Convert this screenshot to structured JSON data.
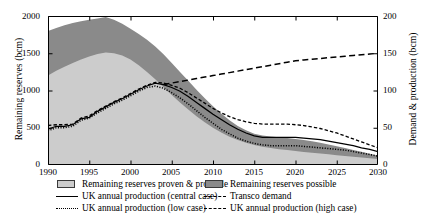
{
  "chart_data": {
    "type": "area",
    "title": "",
    "xlabel": "",
    "ylabel": "Remaining reserves (bcm)",
    "ylabel_right": "Demand & production (bcm)",
    "xlim": [
      1990,
      2030
    ],
    "ylim": [
      0,
      2000
    ],
    "ylim_right": [
      0,
      200
    ],
    "grid": false,
    "legend_position": "below",
    "xticks": [
      "1990",
      "1995",
      "2000",
      "2005",
      "2010",
      "2015",
      "2020",
      "2025",
      "2030"
    ],
    "yticks_left": [
      "0",
      "500",
      "1000",
      "1500",
      "2000"
    ],
    "yticks_right": [
      "0",
      "50",
      "100",
      "150",
      "200"
    ],
    "x": [
      1990,
      1991,
      1992,
      1993,
      1994,
      1995,
      1996,
      1997,
      1998,
      1999,
      2000,
      2001,
      2002,
      2003,
      2004,
      2005,
      2006,
      2007,
      2008,
      2009,
      2010,
      2011,
      2012,
      2013,
      2014,
      2015,
      2016,
      2017,
      2018,
      2019,
      2020,
      2021,
      2022,
      2023,
      2024,
      2025,
      2026,
      2027,
      2028,
      2029,
      2030
    ],
    "series": [
      {
        "name": "Remaining reserves proven & probable",
        "type": "area",
        "axis": "left",
        "color": "#cccccc",
        "values": [
          1200,
          1265,
          1320,
          1370,
          1415,
          1455,
          1490,
          1510,
          1500,
          1470,
          1415,
          1340,
          1250,
          1150,
          1045,
          940,
          840,
          745,
          655,
          575,
          500,
          435,
          380,
          335,
          298,
          268,
          245,
          228,
          213,
          200,
          188,
          176,
          165,
          154,
          143,
          132,
          121,
          110,
          100,
          90,
          80
        ]
      },
      {
        "name": "Remaining reserves possible",
        "type": "area",
        "axis": "left",
        "color": "#8a8a8a",
        "values": [
          1800,
          1840,
          1875,
          1905,
          1930,
          1950,
          1968,
          1985,
          1950,
          1895,
          1830,
          1760,
          1680,
          1590,
          1485,
          1370,
          1250,
          1130,
          1010,
          895,
          790,
          690,
          600,
          525,
          465,
          420,
          395,
          382,
          372,
          362,
          350,
          335,
          318,
          298,
          276,
          252,
          228,
          203,
          178,
          152,
          125
        ]
      },
      {
        "name": "UK annual production (central case)",
        "type": "line",
        "axis": "right",
        "style": "solid",
        "color": "#000000",
        "values": [
          48,
          52,
          52,
          54,
          62,
          64,
          72,
          78,
          84,
          89,
          95,
          101,
          106,
          110,
          108,
          104,
          99,
          92,
          84,
          76,
          68,
          61,
          54,
          48,
          43,
          39,
          37,
          37,
          37,
          37,
          37,
          36,
          35,
          34,
          32,
          30,
          28,
          26,
          23,
          21,
          18
        ]
      },
      {
        "name": "UK annual production (low case)",
        "type": "line",
        "axis": "right",
        "style": "dotted",
        "color": "#000000",
        "values": [
          46,
          50,
          50,
          52,
          60,
          63,
          70,
          76,
          82,
          87,
          93,
          99,
          104,
          106,
          103,
          97,
          90,
          82,
          73,
          64,
          56,
          48,
          42,
          36,
          32,
          29,
          27,
          26,
          26,
          26,
          26,
          25,
          24,
          23,
          22,
          21,
          20,
          18,
          16,
          14,
          12
        ]
      },
      {
        "name": "UK annual production (high case)",
        "type": "line",
        "axis": "right",
        "style": "dashed-short",
        "color": "#000000",
        "values": [
          53,
          54,
          54,
          55,
          63,
          66,
          73,
          79,
          85,
          90,
          96,
          102,
          107,
          111,
          110,
          107,
          103,
          97,
          90,
          83,
          76,
          70,
          65,
          61,
          58,
          56,
          55,
          55,
          55,
          55,
          54,
          53,
          51,
          49,
          46,
          43,
          39,
          35,
          31,
          27,
          23
        ]
      },
      {
        "name": "Transco demand",
        "type": "line",
        "axis": "right",
        "style": "dashed-long",
        "color": "#000000",
        "values": [
          null,
          null,
          null,
          null,
          null,
          null,
          null,
          null,
          null,
          null,
          null,
          null,
          null,
          null,
          108,
          110,
          112,
          114,
          116,
          118,
          120,
          122,
          124,
          126,
          128,
          130,
          132,
          134,
          136,
          138,
          140,
          141,
          142,
          143,
          144,
          145,
          146,
          147,
          148,
          149,
          150
        ]
      }
    ]
  },
  "axes": {
    "left_title": "Remaining reserves (bcm)",
    "right_title": "Demand & production (bcm)",
    "x_ticks": [
      "1990",
      "1995",
      "2000",
      "2005",
      "2010",
      "2015",
      "2020",
      "2025",
      "2030"
    ],
    "y_ticks_left": [
      "0",
      "500",
      "1000",
      "1500",
      "2000"
    ],
    "y_ticks_right": [
      "0",
      "50",
      "100",
      "150",
      "200"
    ]
  },
  "legend": {
    "items": [
      {
        "key": "swatch-light",
        "label": "Remaining reserves proven & probable"
      },
      {
        "key": "swatch-dark",
        "label": "Remaining reserves possible"
      },
      {
        "key": "line-solid",
        "label": "UK annual production (central case)"
      },
      {
        "key": "line-dashed-long",
        "label": "Transco demand"
      },
      {
        "key": "line-dotted",
        "label": "UK annual production (low case)"
      },
      {
        "key": "line-dashed-short",
        "label": "UK annual production (high case)"
      }
    ]
  },
  "colors": {
    "proven_probable": "#cccccc",
    "possible": "#8a8a8a",
    "line": "#000000",
    "axis": "#000000",
    "background": "#ffffff"
  }
}
